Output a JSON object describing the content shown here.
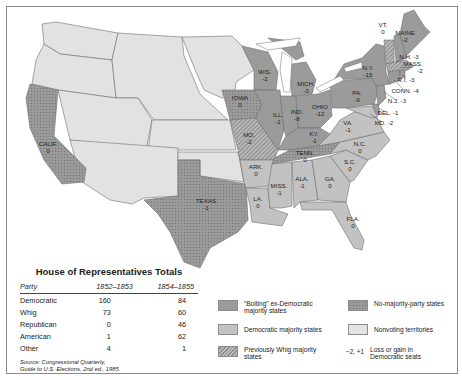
{
  "map": {
    "colors": {
      "bolting": "#9b9b9b",
      "democratic": "#c2c2c2",
      "whig": "#a5a5a5",
      "no_majority": "#9a9a9a",
      "nonvoting": "#e2e2e2",
      "water": "#ffffff",
      "border": "#6f6f6f"
    },
    "states": [
      {
        "name": "CALIF.",
        "change": "0",
        "category": "no_majority"
      },
      {
        "name": "TEXAS",
        "change": "-1",
        "category": "no_majority"
      },
      {
        "name": "IOWA",
        "change": "0",
        "category": "no_majority"
      },
      {
        "name": "MO.",
        "change": "-2",
        "category": "whig"
      },
      {
        "name": "ARK.",
        "change": "0",
        "category": "democratic"
      },
      {
        "name": "LA.",
        "change": "0",
        "category": "democratic"
      },
      {
        "name": "WIS.",
        "change": "-2",
        "category": "bolting"
      },
      {
        "name": "ILL.",
        "change": "-1",
        "category": "bolting"
      },
      {
        "name": "MICH.",
        "change": "-3",
        "category": "bolting"
      },
      {
        "name": "IND.",
        "change": "-8",
        "category": "bolting"
      },
      {
        "name": "OHIO",
        "change": "-12",
        "category": "bolting"
      },
      {
        "name": "KY.",
        "change": "-1",
        "category": "bolting"
      },
      {
        "name": "TENN.",
        "change": "0",
        "category": "no_majority"
      },
      {
        "name": "MISS.",
        "change": "-1",
        "category": "democratic"
      },
      {
        "name": "ALA.",
        "change": "-1",
        "category": "democratic"
      },
      {
        "name": "GA.",
        "change": "0",
        "category": "democratic"
      },
      {
        "name": "FLA.",
        "change": "0",
        "category": "democratic"
      },
      {
        "name": "S.C.",
        "change": "0",
        "category": "democratic"
      },
      {
        "name": "N.C.",
        "change": "0",
        "category": "democratic"
      },
      {
        "name": "VA.",
        "change": "-1",
        "category": "democratic"
      },
      {
        "name": "PA.",
        "change": "-9",
        "category": "bolting"
      },
      {
        "name": "N.Y.",
        "change": "-15",
        "category": "bolting"
      },
      {
        "name": "VT.",
        "change": "0",
        "category": "whig"
      },
      {
        "name": "MAINE",
        "change": "-2",
        "category": "bolting"
      },
      {
        "name": "N.H.",
        "change": "-3",
        "category": "bolting"
      },
      {
        "name": "MASS.",
        "change": "-2",
        "category": "whig"
      },
      {
        "name": "R.I.",
        "change": "-3",
        "category": "bolting"
      },
      {
        "name": "CONN.",
        "change": "-4",
        "category": "bolting"
      },
      {
        "name": "N.J.",
        "change": "-3",
        "category": "bolting"
      },
      {
        "name": "DEL.",
        "change": "-1",
        "category": "bolting"
      },
      {
        "name": "MD.",
        "change": "-2",
        "category": "democratic"
      }
    ]
  },
  "table": {
    "title": "House of Representatives Totals",
    "headers": [
      "Party",
      "1852–1853",
      "1854–1855"
    ],
    "rows": [
      [
        "Democratic",
        "160",
        "84"
      ],
      [
        "Whig",
        "73",
        "60"
      ],
      [
        "Republican",
        "0",
        "46"
      ],
      [
        "American",
        "1",
        "62"
      ],
      [
        "Other",
        "4",
        "1"
      ]
    ],
    "source_line1": "Source: Congressional Quarterly,",
    "source_line2": "Guide to U.S. Elections, 2nd ed., 1985."
  },
  "legend": {
    "items": [
      {
        "key": "bolting",
        "label": "“Bolting” ex-Democratic majority states"
      },
      {
        "key": "no_majority",
        "label": "No-majority-party states"
      },
      {
        "key": "democratic",
        "label": "Democratic majority states"
      },
      {
        "key": "nonvoting",
        "label": "Nonvoting territories"
      },
      {
        "key": "whig",
        "label": "Previously Whig majority states"
      },
      {
        "key": "number",
        "swatch_text": "−2, +1",
        "label": "Loss or gain in Democratic seats"
      }
    ]
  }
}
